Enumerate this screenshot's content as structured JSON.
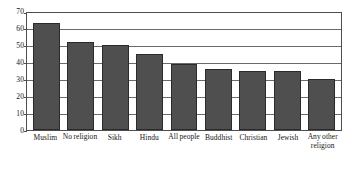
{
  "chart_data": {
    "type": "bar",
    "title": "",
    "xlabel": "",
    "ylabel": "",
    "categories": [
      "Muslim",
      "No religion",
      "Sikh",
      "Hindu",
      "All people",
      "Buddhist",
      "Christian",
      "Jewish",
      "Any other religion"
    ],
    "values": [
      63,
      52,
      50,
      45,
      39,
      36,
      35,
      35,
      30
    ],
    "ylim": [
      0,
      70
    ],
    "yticks": [
      0,
      10,
      20,
      30,
      40,
      50,
      60,
      70
    ],
    "ytick_labels": [
      "0",
      "10",
      "20",
      "30",
      "40",
      "50",
      "60",
      "70"
    ],
    "grid": true,
    "grid_axis": "y",
    "legend": false,
    "bar_color": "#4f4f4f",
    "bar_edge_color": "#2b2b2b",
    "grid_color": "#6a6a6a",
    "axis_color": "#4d4d4d",
    "background_color": "#ffffff"
  }
}
